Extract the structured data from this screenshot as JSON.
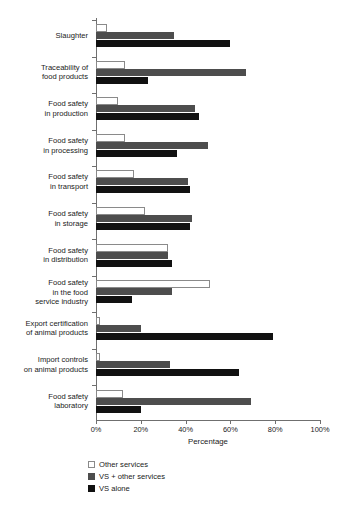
{
  "chart_data": {
    "type": "bar",
    "orientation": "horizontal",
    "title": "",
    "xlabel": "Percentage",
    "ylabel": "",
    "xlim": [
      0,
      100
    ],
    "grid": false,
    "legend_position": "bottom-left",
    "xticks": [
      "0%",
      "20%",
      "40%",
      "60%",
      "80%",
      "100%"
    ],
    "xtick_values": [
      0,
      20,
      40,
      60,
      80,
      100
    ],
    "categories": [
      "Slaughter",
      "Traceability of food products",
      "Food safety in production",
      "Food safety in processing",
      "Food safety in transport",
      "Food safety in storage",
      "Food safety in distribution",
      "Food safety in the food service industry",
      "Export certification of animal products",
      "Import controls on animal products",
      "Food safety laboratory"
    ],
    "category_lines": [
      [
        "Slaughter"
      ],
      [
        "Traceability of",
        "food products"
      ],
      [
        "Food safety",
        "in production"
      ],
      [
        "Food safety",
        "in processing"
      ],
      [
        "Food safety",
        "in transport"
      ],
      [
        "Food safety",
        "in storage"
      ],
      [
        "Food safety",
        "in distribution"
      ],
      [
        "Food safety",
        "in the food",
        "service industry"
      ],
      [
        "Export certification",
        "of animal products"
      ],
      [
        "Import controls",
        "on animal products"
      ],
      [
        "Food safety",
        "laboratory"
      ]
    ],
    "series": [
      {
        "name": "Other services",
        "color": "#ffffff",
        "edge_color": "#8a8a8a",
        "values": [
          5,
          13,
          10,
          13,
          17,
          22,
          32,
          51,
          2,
          2,
          12
        ]
      },
      {
        "name": "VS + other services",
        "color": "#4d4d4d",
        "values": [
          35,
          67,
          44,
          50,
          41,
          43,
          32,
          34,
          20,
          33,
          69
        ]
      },
      {
        "name": "VS alone",
        "color": "#111111",
        "values": [
          60,
          23,
          46,
          36,
          42,
          42,
          34,
          16,
          79,
          64,
          20
        ]
      }
    ]
  },
  "legend": {
    "items": [
      {
        "label": "Other services",
        "swatch": "other"
      },
      {
        "label": "VS + other services",
        "swatch": "vsother"
      },
      {
        "label": "VS alone",
        "swatch": "vsalone"
      }
    ]
  },
  "axis": {
    "x_title": "Percentage"
  }
}
